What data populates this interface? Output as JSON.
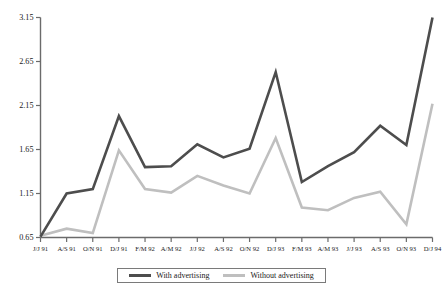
{
  "chart_data": {
    "type": "line",
    "title": "",
    "subtitle": "",
    "xlabel": "",
    "ylabel": "",
    "ylim": [
      0.65,
      3.15
    ],
    "yticks": [
      "0.65",
      "1.15",
      "1.65",
      "2.15",
      "2.65",
      "3.15"
    ],
    "grid": false,
    "legend_position": "bottom-center",
    "categories": [
      "J/J 91",
      "A/S 91",
      "O/N 91",
      "D/J 91",
      "F/M 92",
      "A/M 92",
      "J/J 92",
      "A/S 92",
      "O/N 92",
      "D/J 93",
      "F/M 93",
      "A/M 93",
      "J/J 93",
      "A/S 93",
      "O/N 93",
      "D/J 94"
    ],
    "series": [
      {
        "name": "With advertising",
        "color": "#4d4d4d",
        "values": [
          0.66,
          1.15,
          1.2,
          2.03,
          1.45,
          1.46,
          1.71,
          1.56,
          1.66,
          2.53,
          1.28,
          1.46,
          1.62,
          1.92,
          1.7,
          3.15
        ]
      },
      {
        "name": "Without advertising",
        "color": "#bfbfbf",
        "values": [
          0.67,
          0.75,
          0.7,
          1.64,
          1.2,
          1.16,
          1.35,
          1.24,
          1.15,
          1.78,
          0.99,
          0.96,
          1.1,
          1.17,
          0.8,
          2.17
        ]
      }
    ],
    "legend": [
      {
        "label": "With advertising",
        "color": "#4d4d4d"
      },
      {
        "label": "Without advertising",
        "color": "#bfbfbf"
      }
    ]
  },
  "legend": {
    "with_label": "With advertising",
    "without_label": "Without advertising"
  }
}
